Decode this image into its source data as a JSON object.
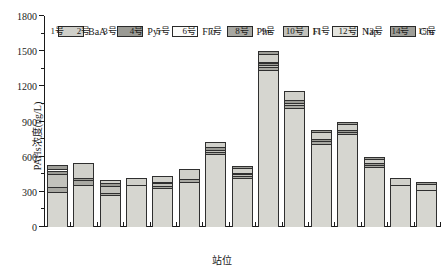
{
  "chart_data": {
    "type": "bar",
    "stacked": true,
    "title": "",
    "xlabel": "站位",
    "ylabel": "PAHs浓度(ng/L)",
    "ylim": [
      0,
      1800
    ],
    "ytick_values": [
      0,
      300,
      600,
      900,
      1200,
      1500,
      1800
    ],
    "ytick_labels": [
      "0",
      "300",
      "600",
      "900",
      "1200",
      "1500",
      "1800"
    ],
    "minor_ticks": true,
    "grid": false,
    "legend_position": "top",
    "categories": [
      "1号",
      "2号",
      "3号",
      "4号",
      "5号",
      "6号",
      "7号",
      "8号",
      "9号",
      "10号",
      "11号",
      "12号",
      "13号",
      "14号",
      "15号"
    ],
    "series": [
      {
        "name": "Nap",
        "color": "#d6d6d0",
        "values": [
          295,
          355,
          272,
          358,
          332,
          388,
          620,
          415,
          1340,
          1018,
          712,
          795,
          508,
          358,
          315
        ]
      },
      {
        "name": "Phe",
        "color": "#a8a8a2",
        "values": [
          50,
          50,
          22,
          0,
          18,
          22,
          18,
          16,
          22,
          22,
          18,
          18,
          20,
          0,
          0
        ]
      },
      {
        "name": "Fl",
        "color": "#c2c2bc",
        "values": [
          108,
          0,
          58,
          0,
          22,
          0,
          22,
          18,
          18,
          22,
          0,
          0,
          0,
          0,
          0
        ]
      },
      {
        "name": "Pyr",
        "color": "#9a9a94",
        "values": [
          25,
          12,
          20,
          0,
          12,
          0,
          22,
          12,
          20,
          20,
          18,
          18,
          16,
          0,
          0
        ]
      },
      {
        "name": "Flu",
        "color": "#fcfcfa",
        "values": [
          15,
          0,
          0,
          0,
          0,
          0,
          0,
          0,
          12,
          0,
          0,
          0,
          0,
          0,
          0
        ]
      },
      {
        "name": "BaA",
        "color": "#d0d0ca",
        "values": [
          0,
          128,
          30,
          62,
          50,
          82,
          42,
          42,
          60,
          82,
          62,
          50,
          36,
          62,
          48
        ]
      },
      {
        "name": "Chr",
        "color": "#9e9e98",
        "values": [
          32,
          0,
          0,
          0,
          0,
          0,
          0,
          18,
          28,
          0,
          18,
          12,
          20,
          0,
          18
        ]
      }
    ],
    "totals": [
      525,
      545,
      402,
      420,
      434,
      492,
      744,
      521,
      1500,
      1164,
      828,
      893,
      600,
      420,
      381
    ],
    "legend": [
      {
        "label": "BaA",
        "color": "#d0d0ca"
      },
      {
        "label": "Pyr",
        "color": "#9a9a94"
      },
      {
        "label": "Flu",
        "color": "#fcfcfa"
      },
      {
        "label": "Phe",
        "color": "#a8a8a2"
      },
      {
        "label": "Fl",
        "color": "#c2c2bc"
      },
      {
        "label": "Nap",
        "color": "#e4e4de"
      },
      {
        "label": "Chr",
        "color": "#9e9e98"
      }
    ]
  }
}
